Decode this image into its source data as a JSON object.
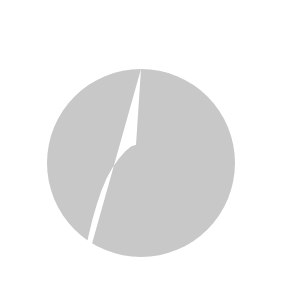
{
  "diagram": {
    "annotation_label": "Solutions",
    "circle_label": {
      "x": "x",
      "sup1": "2",
      "plus": " + ",
      "y": "y",
      "sup2": "2",
      "rel": " ≤ 25"
    },
    "parabola_label": {
      "y": "y",
      "rel": " ≥ −",
      "x": "x",
      "sup": "2",
      "tail": " + 5"
    },
    "x_axis": {
      "tick_labels": [
        "−5",
        "5"
      ],
      "range": [
        -7,
        7
      ]
    },
    "y_axis": {
      "tick_labels": [
        "6",
        "4",
        "2",
        "−2",
        "−4",
        "−6"
      ],
      "range": [
        -7,
        7
      ]
    },
    "colors": {
      "shade": "#c8c8c8",
      "line": "#1a1a1a",
      "background": "#ffffff"
    },
    "curves": [
      {
        "name": "circle",
        "equation": "x^2 + y^2 = 25",
        "inequality": "x^2 + y^2 <= 25"
      },
      {
        "name": "parabola",
        "equation": "y = -x^2 + 5",
        "inequality": "y >= -x^2 + 5"
      }
    ]
  }
}
